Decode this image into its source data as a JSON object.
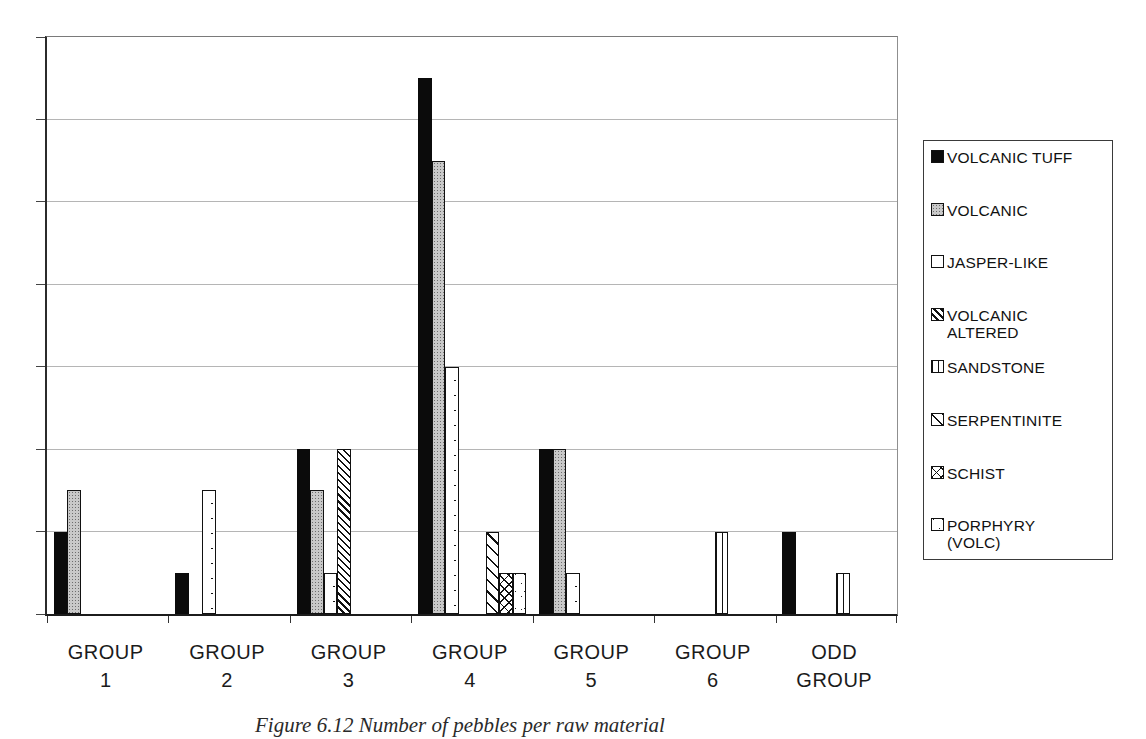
{
  "caption": "Figure 6.12 Number of pebbles per raw material",
  "colors": {
    "bar_fill_black": "#0b0b0b",
    "bar_outline": "#111111",
    "volcanic_gray": "#c9c9c9",
    "gridline": "#b5b5b5",
    "axis": "#222222",
    "background": "#ffffff"
  },
  "chart_data": {
    "type": "bar",
    "title": "",
    "xlabel": "",
    "ylabel": "",
    "ylim": [
      0,
      14
    ],
    "y_grid_step": 2,
    "y_axis_labels_visible": false,
    "grid": true,
    "legend_position": "right",
    "categories": [
      {
        "lines": [
          "GROUP",
          "1"
        ]
      },
      {
        "lines": [
          "GROUP",
          "2"
        ]
      },
      {
        "lines": [
          "GROUP",
          "3"
        ]
      },
      {
        "lines": [
          "GROUP",
          "4"
        ]
      },
      {
        "lines": [
          "GROUP",
          "5"
        ]
      },
      {
        "lines": [
          "GROUP",
          "6"
        ]
      },
      {
        "lines": [
          "ODD",
          "GROUP"
        ]
      }
    ],
    "series": [
      {
        "name": "VOLCANIC TUFF",
        "legend_lines": [
          "VOLCANIC TUFF"
        ],
        "pattern": "solid-black",
        "values": [
          2,
          1,
          4,
          13,
          4,
          0,
          2
        ]
      },
      {
        "name": "VOLCANIC",
        "legend_lines": [
          "VOLCANIC"
        ],
        "pattern": "gray-stipple",
        "values": [
          3,
          0,
          3,
          11,
          4,
          0,
          0
        ]
      },
      {
        "name": "JASPER-LIKE",
        "legend_lines": [
          "JASPER-LIKE"
        ],
        "pattern": "sparse-dots",
        "values": [
          0,
          3,
          1,
          6,
          1,
          0,
          0
        ]
      },
      {
        "name": "VOLCANIC ALTERED",
        "legend_lines": [
          "VOLCANIC",
          "ALTERED"
        ],
        "pattern": "dense-backslash",
        "values": [
          0,
          0,
          4,
          0,
          0,
          0,
          0
        ]
      },
      {
        "name": "SANDSTONE",
        "legend_lines": [
          "SANDSTONE"
        ],
        "pattern": "vertical-lines",
        "values": [
          0,
          0,
          0,
          0,
          0,
          2,
          1
        ]
      },
      {
        "name": "SERPENTINITE",
        "legend_lines": [
          "SERPENTINITE"
        ],
        "pattern": "light-backslash",
        "values": [
          0,
          0,
          0,
          2,
          0,
          0,
          0
        ]
      },
      {
        "name": "SCHIST",
        "legend_lines": [
          "SCHIST"
        ],
        "pattern": "crosshatch",
        "values": [
          0,
          0,
          0,
          1,
          0,
          0,
          0
        ]
      },
      {
        "name": "PORPHYRY (VOLC)",
        "legend_lines": [
          "PORPHYRY",
          "(VOLC)"
        ],
        "pattern": "speckle",
        "values": [
          0,
          0,
          0,
          1,
          0,
          0,
          0
        ]
      }
    ]
  }
}
